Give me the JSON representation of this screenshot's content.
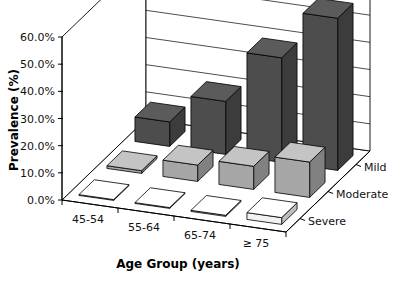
{
  "chart_data": {
    "type": "bar",
    "subtype": "3d-grouped-bar",
    "title": "",
    "xlabel": "Age Group (years)",
    "ylabel": "Prevalence (%)",
    "zlabel": "",
    "categories": [
      "45-54",
      "55-64",
      "65-74",
      "≥ 75"
    ],
    "series": [
      {
        "name": "Mild",
        "values": [
          9.0,
          19.5,
          38.5,
          56.0
        ]
      },
      {
        "name": "Moderate",
        "values": [
          1.0,
          6.0,
          8.5,
          13.0
        ]
      },
      {
        "name": "Severe",
        "values": [
          0.3,
          0.3,
          0.4,
          2.5
        ]
      }
    ],
    "ylim": [
      0,
      60
    ],
    "yticks": [
      0,
      10,
      20,
      30,
      40,
      50,
      60
    ],
    "ytick_labels": [
      "0.0%",
      "10.0%",
      "20.0%",
      "30.0%",
      "40.0%",
      "50.0%",
      "60.0%"
    ],
    "grid": true,
    "legend": "depth-axis",
    "series_colors": [
      "#4d4d4d",
      "#a6a6a6",
      "#f2f2f2"
    ]
  },
  "axes": {
    "y_title": "Prevalence (%)",
    "x_title": "Age Group (years)"
  },
  "series_labels": {
    "mild": "Mild",
    "moderate": "Moderate",
    "severe": "Severe"
  }
}
